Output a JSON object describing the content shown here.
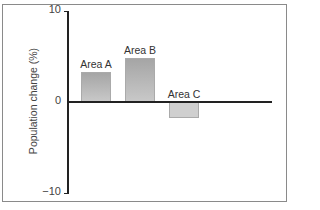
{
  "chart_data": {
    "type": "bar",
    "title": "",
    "xlabel": "",
    "ylabel": "Population change (%)",
    "categories": [
      "Area A",
      "Area B",
      "Area C"
    ],
    "values": [
      3.3,
      4.8,
      -1.8
    ],
    "ylim": [
      -10,
      10
    ],
    "yticks": [
      10,
      0,
      -10
    ],
    "ytick_labels": [
      "10",
      "0",
      "−10"
    ],
    "grid": false,
    "legend": null,
    "bar_color": "#b5b5b5"
  }
}
